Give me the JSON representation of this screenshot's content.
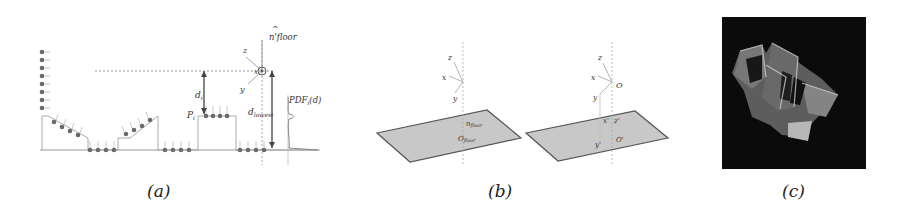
{
  "figure": {
    "panels": [
      {
        "id": "a",
        "caption": "(a)",
        "labels": {
          "normal": "n'floor",
          "normal_hat": "^",
          "axis_z": "z",
          "axis_x": "x",
          "axis_y": "y",
          "distance_i": "d",
          "distance_i_sub": "i",
          "point_i": "P",
          "point_i_sub": "i",
          "distance_lowest": "d",
          "distance_lowest_sub": "lowest",
          "pdf": "PDF",
          "pdf_sub": "i",
          "pdf_arg": "(d)"
        }
      },
      {
        "id": "b",
        "caption": "(b)",
        "left_labels": {
          "axis_z": "z",
          "axis_x": "x",
          "axis_y": "y",
          "normal": "n",
          "normal_sub": "floor",
          "origin": "O",
          "origin_sub": "floor"
        },
        "right_labels": {
          "axis_z": "z",
          "axis_x": "x",
          "axis_y": "y",
          "origin": "O",
          "axis_z_prime": "z'",
          "axis_x_prime": "x'",
          "axis_y_prime": "y'",
          "origin_prime": "O'"
        }
      },
      {
        "id": "c",
        "caption": "(c)",
        "image": "3d-point-cloud-rendering"
      }
    ],
    "colors": {
      "line": "#8a8a8a",
      "dark_line": "#444444",
      "plane_fill": "#c8c8c8",
      "plane_edge": "#555555",
      "dot": "#6a6a6a",
      "panel_c_bg": "#0b0b0b"
    }
  }
}
